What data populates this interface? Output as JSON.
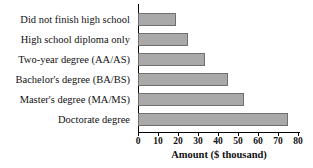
{
  "chart_data": {
    "type": "bar",
    "orientation": "horizontal",
    "title": "",
    "xlabel": "Amount ($ thousand)",
    "ylabel": "",
    "xlim": [
      0,
      80
    ],
    "xticks": [
      0,
      10,
      20,
      30,
      40,
      50,
      60,
      70,
      80
    ],
    "grid": false,
    "legend": null,
    "categories": [
      "Did not finish high school",
      "High school diploma only",
      "Two-year degree (AA/AS)",
      "Bachelor's degree (BA/BS)",
      "Master's degree (MA/MS)",
      "Doctorate degree"
    ],
    "values": [
      19,
      25,
      33.5,
      45,
      53,
      75
    ],
    "bar_color": "#a9a9a9",
    "bar_border_color": "#6f6f6f",
    "axis_color": "#000000"
  }
}
